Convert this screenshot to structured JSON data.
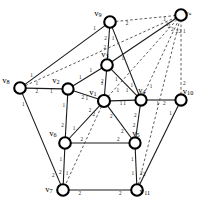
{
  "figure": {
    "background_color": "#ffffff",
    "node_stroke_color": "#000000",
    "node_fill_color": "#ffffff",
    "solid_edge_color": "#1a1a1a",
    "dashed_edge_color": "#4a4a4a"
  },
  "nodes": [
    {
      "id": "v1",
      "label": "v",
      "sub": "1",
      "x": 104,
      "y": 101,
      "r": 6.0,
      "label_dx": -11,
      "label_dy": -8
    },
    {
      "id": "v2",
      "label": "v",
      "sub": "2",
      "x": 68,
      "y": 89,
      "r": 5.6,
      "label_dx": -12,
      "label_dy": -8
    },
    {
      "id": "v3",
      "label": "v",
      "sub": "3",
      "x": 107,
      "y": 65,
      "r": 5.8,
      "label_dx": -2,
      "label_dy": -10
    },
    {
      "id": "v4",
      "label": "v",
      "sub": "4",
      "x": 141,
      "y": 100,
      "r": 5.6,
      "label_dx": 1,
      "label_dy": -9
    },
    {
      "id": "v5",
      "label": "v",
      "sub": "5",
      "x": 135,
      "y": 143,
      "r": 5.6,
      "label_dx": 1,
      "label_dy": -9
    },
    {
      "id": "v6",
      "label": "v",
      "sub": "6",
      "x": 65,
      "y": 143,
      "r": 5.8,
      "label_dx": -12,
      "label_dy": -9
    },
    {
      "id": "v7",
      "label": "v",
      "sub": "7",
      "x": 63,
      "y": 190,
      "r": 5.8,
      "label_dx": -14,
      "label_dy": 0
    },
    {
      "id": "v8",
      "label": "v",
      "sub": "8",
      "x": 20,
      "y": 88,
      "r": 5.8,
      "label_dx": -14,
      "label_dy": -7
    },
    {
      "id": "v9",
      "label": "v",
      "sub": "9",
      "x": 110,
      "y": 22,
      "r": 5.8,
      "label_dx": -12,
      "label_dy": -8
    },
    {
      "id": "v10",
      "label": "v",
      "sub": "10",
      "x": 181,
      "y": 100,
      "r": 5.6,
      "label_dx": 7,
      "label_dy": -8
    },
    {
      "id": "v11",
      "label": "v",
      "sub": "11",
      "x": 137,
      "y": 190,
      "r": 5.8,
      "label_dx": 8,
      "label_dy": 2
    },
    {
      "id": "vstar",
      "label": "v",
      "sub": "*",
      "x": 181,
      "y": 15,
      "r": 5.8,
      "label_dx": 7,
      "label_dy": -1
    }
  ],
  "edges": [
    {
      "from": "v9",
      "to": "v8",
      "style": "solid",
      "w_from": "1",
      "w_to": "1"
    },
    {
      "from": "v9",
      "to": "v3",
      "style": "solid",
      "w_from": "2",
      "w_to": "2"
    },
    {
      "from": "v9",
      "to": "v4",
      "style": "solid",
      "w_from": "1",
      "w_to": "1"
    },
    {
      "from": "v9",
      "to": "vstar",
      "style": "dashed",
      "w_from": "2",
      "w_to": "1"
    },
    {
      "from": "v8",
      "to": "vstar",
      "style": "dashed",
      "w_from": "1",
      "w_to": "1"
    },
    {
      "from": "v8",
      "to": "v2",
      "style": "solid",
      "w_from": "2",
      "w_to": "1"
    },
    {
      "from": "v8",
      "to": "v7",
      "style": "solid",
      "w_from": "1",
      "w_to": "2"
    },
    {
      "from": "v3",
      "to": "v2",
      "style": "solid",
      "w_from": "1",
      "w_to": "1"
    },
    {
      "from": "v3",
      "to": "v1",
      "style": "solid",
      "w_from": "2",
      "w_to": "1"
    },
    {
      "from": "v3",
      "to": "v4",
      "style": "solid",
      "w_from": "1",
      "w_to": "1"
    },
    {
      "from": "v3",
      "to": "vstar",
      "style": "solid",
      "w_from": "1",
      "w_to": "2"
    },
    {
      "from": "v2",
      "to": "v1",
      "style": "solid",
      "w_from": "2",
      "w_to": "1"
    },
    {
      "from": "v2",
      "to": "v6",
      "style": "solid",
      "w_from": "1",
      "w_to": "2"
    },
    {
      "from": "v1",
      "to": "v4",
      "style": "solid",
      "w_from": "1",
      "w_to": "1"
    },
    {
      "from": "v1",
      "to": "v6",
      "style": "solid",
      "w_from": "2",
      "w_to": "1"
    },
    {
      "from": "v1",
      "to": "v5",
      "style": "solid",
      "w_from": "2",
      "w_to": "2"
    },
    {
      "from": "v1",
      "to": "v7",
      "style": "dashed",
      "w_from": "2",
      "w_to": "1"
    },
    {
      "from": "v1",
      "to": "vstar",
      "style": "dashed",
      "w_from": "1",
      "w_to": "2"
    },
    {
      "from": "v4",
      "to": "v10",
      "style": "solid",
      "w_from": "1",
      "w_to": "2"
    },
    {
      "from": "v4",
      "to": "v5",
      "style": "solid",
      "w_from": "2",
      "w_to": "2"
    },
    {
      "from": "v4",
      "to": "vstar",
      "style": "dashed",
      "w_from": "1",
      "w_to": "2"
    },
    {
      "from": "v10",
      "to": "vstar",
      "style": "dashed",
      "w_from": "2",
      "w_to": "1"
    },
    {
      "from": "v10",
      "to": "v11",
      "style": "solid",
      "w_from": "1",
      "w_to": "2"
    },
    {
      "from": "v5",
      "to": "v6",
      "style": "solid",
      "w_from": "2",
      "w_to": "2"
    },
    {
      "from": "v5",
      "to": "v11",
      "style": "solid",
      "w_from": "1",
      "w_to": "1"
    },
    {
      "from": "v6",
      "to": "v7",
      "style": "solid",
      "w_from": "1",
      "w_to": "2"
    },
    {
      "from": "v7",
      "to": "v11",
      "style": "solid",
      "w_from": "2",
      "w_to": "2"
    },
    {
      "from": "v11",
      "to": "vstar",
      "style": "dashed",
      "w_from": "2",
      "w_to": "2"
    }
  ]
}
